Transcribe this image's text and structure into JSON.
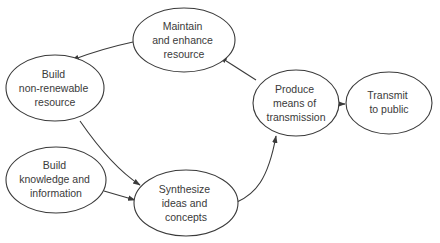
{
  "diagram": {
    "type": "process-flow",
    "nodes": [
      {
        "id": "maintain",
        "lines": [
          "Maintain",
          "and enhance",
          "resource"
        ]
      },
      {
        "id": "nonrenewable",
        "lines": [
          "Build",
          "non-renewable",
          "resource"
        ]
      },
      {
        "id": "knowledge",
        "lines": [
          "Build",
          "knowledge and",
          "information"
        ]
      },
      {
        "id": "synthesize",
        "lines": [
          "Synthesize",
          "ideas and",
          "concepts"
        ]
      },
      {
        "id": "produce",
        "lines": [
          "Produce",
          "means of",
          "transmission"
        ]
      },
      {
        "id": "transmit",
        "lines": [
          "Transmit",
          "to public"
        ]
      }
    ],
    "edges": [
      {
        "from": "maintain",
        "to": "nonrenewable"
      },
      {
        "from": "nonrenewable",
        "to": "synthesize"
      },
      {
        "from": "knowledge",
        "to": "synthesize"
      },
      {
        "from": "synthesize",
        "to": "produce"
      },
      {
        "from": "produce",
        "to": "maintain"
      },
      {
        "from": "produce",
        "to": "transmit"
      }
    ],
    "colors": {
      "stroke": "#3a3a3a",
      "background": "#ffffff"
    }
  }
}
